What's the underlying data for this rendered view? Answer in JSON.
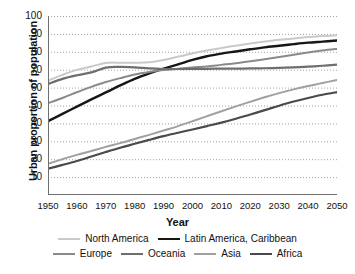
{
  "chart_data": {
    "type": "line",
    "title": "",
    "xlabel": "Year",
    "ylabel": "Urban proportion of population",
    "xlim": [
      1950,
      2050
    ],
    "ylim": [
      0,
      100
    ],
    "grid": true,
    "legend_position": "bottom",
    "x": [
      1950,
      1955,
      1960,
      1965,
      1970,
      1975,
      1980,
      1985,
      1990,
      1995,
      2000,
      2005,
      2010,
      2015,
      2020,
      2025,
      2030,
      2035,
      2040,
      2045,
      2050
    ],
    "xticks": [
      "1950",
      "1960",
      "1970",
      "1980",
      "1990",
      "2000",
      "2010",
      "2020",
      "2030",
      "2040",
      "2050"
    ],
    "yticks": [
      "10",
      "20",
      "30",
      "40",
      "50",
      "60",
      "70",
      "80",
      "90",
      "100"
    ],
    "series": [
      {
        "name": "North America",
        "color": "#c9c9c9",
        "width": 2.0,
        "values": [
          63.9,
          67.1,
          69.9,
          71.8,
          73.8,
          73.9,
          73.9,
          74.1,
          75.4,
          77.3,
          79.1,
          80.7,
          82.1,
          83.4,
          84.6,
          85.7,
          86.7,
          87.5,
          88.2,
          88.8,
          89.2
        ]
      },
      {
        "name": "Latin America, Caribbean",
        "color": "#161616",
        "width": 2.4,
        "values": [
          41.3,
          45.3,
          49.4,
          53.4,
          57.3,
          61.2,
          64.9,
          67.9,
          70.6,
          73.0,
          75.5,
          77.5,
          79.0,
          80.2,
          81.4,
          82.5,
          83.4,
          84.3,
          85.1,
          85.7,
          86.3
        ]
      },
      {
        "name": "Europe",
        "color": "#8a8a8a",
        "width": 2.0,
        "values": [
          51.3,
          54.2,
          57.4,
          60.4,
          63.1,
          65.3,
          67.3,
          68.7,
          69.8,
          70.5,
          71.2,
          71.8,
          72.7,
          73.6,
          74.7,
          75.9,
          77.1,
          78.4,
          79.6,
          80.7,
          81.6
        ]
      },
      {
        "name": "Oceania",
        "color": "#6e6e6e",
        "width": 2.2,
        "values": [
          62.0,
          64.9,
          66.9,
          68.5,
          71.2,
          71.6,
          71.3,
          70.7,
          70.4,
          70.4,
          70.5,
          70.5,
          70.6,
          70.6,
          70.7,
          70.8,
          71.0,
          71.3,
          71.7,
          72.2,
          72.8
        ]
      },
      {
        "name": "Asia",
        "color": "#a0a0a0",
        "width": 2.0,
        "values": [
          17.5,
          20.0,
          22.4,
          24.6,
          26.9,
          29.0,
          31.3,
          33.6,
          36.0,
          38.5,
          41.2,
          44.0,
          46.8,
          49.5,
          52.1,
          54.6,
          56.9,
          59.0,
          60.9,
          62.6,
          64.2
        ]
      },
      {
        "name": "Africa",
        "color": "#4a4a4a",
        "width": 2.2,
        "values": [
          14.7,
          16.8,
          19.0,
          21.5,
          24.0,
          26.4,
          28.6,
          30.8,
          32.9,
          34.8,
          36.6,
          38.5,
          40.4,
          42.6,
          45.0,
          47.4,
          49.9,
          52.2,
          54.2,
          56.0,
          57.5
        ]
      }
    ]
  },
  "axis": {
    "ylabel": "Urban proportion of population",
    "xlabel": "Year"
  },
  "legend": {
    "row1": [
      {
        "label": "North America",
        "color": "#c9c9c9",
        "width": 2.0
      },
      {
        "label": "Latin America, Caribbean",
        "color": "#161616",
        "width": 2.8
      }
    ],
    "row2": [
      {
        "label": "Europe",
        "color": "#8a8a8a",
        "width": 2.2
      },
      {
        "label": "Oceania",
        "color": "#6e6e6e",
        "width": 2.4
      },
      {
        "label": "Asia",
        "color": "#a0a0a0",
        "width": 2.2
      },
      {
        "label": "Africa",
        "color": "#4a4a4a",
        "width": 2.6
      }
    ]
  },
  "style": {
    "background": "#ffffff",
    "axis_color": "#6f6f6f",
    "grid_color": "#9a9a9a",
    "text_color": "#111111"
  }
}
